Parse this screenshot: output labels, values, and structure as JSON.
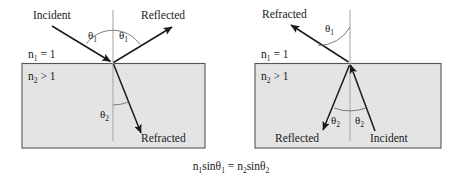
{
  "figure": {
    "equation": {
      "n1": "n",
      "n1_sub": "1",
      "sin1": "sinθ",
      "theta1_sub": "1",
      "equals": "=",
      "n2": "n",
      "n2_sub": "2",
      "sin2": "sinθ",
      "theta2_sub": "2"
    },
    "colors": {
      "medium_fill": "#e4e4e4",
      "medium_stroke": "#555555",
      "ray": "#1a1a1a",
      "normal": "#b0b0b0",
      "arc": "#6e6e6e",
      "background": "#ffffff"
    },
    "panels": [
      {
        "id": "left-panel",
        "name": "light-entering-denser-medium",
        "media": {
          "upper_label": "n",
          "upper_sub": "1",
          "upper_rel": " = 1",
          "lower_label": "n",
          "lower_sub": "2",
          "lower_rel": " > 1"
        },
        "rays": [
          {
            "name": "incident-ray",
            "label": "Incident",
            "direction": "down-right-to-interface"
          },
          {
            "name": "reflected-ray",
            "label": "Reflected",
            "direction": "up-right-from-interface"
          },
          {
            "name": "refracted-ray",
            "label": "Refracted",
            "direction": "down-right-into-medium"
          }
        ],
        "angles": [
          {
            "name": "theta1-incident",
            "symbol": "θ",
            "sub": "1",
            "side": "left-of-normal"
          },
          {
            "name": "theta1-reflected",
            "symbol": "θ",
            "sub": "1",
            "side": "right-of-normal"
          },
          {
            "name": "theta2-refracted",
            "symbol": "θ",
            "sub": "2",
            "side": "left-of-normal-below"
          }
        ]
      },
      {
        "id": "right-panel",
        "name": "light-exiting-denser-medium",
        "media": {
          "upper_label": "n",
          "upper_sub": "1",
          "upper_rel": " = 1",
          "lower_label": "n",
          "lower_sub": "2",
          "lower_rel": " > 1"
        },
        "rays": [
          {
            "name": "refracted-ray",
            "label": "Refracted",
            "direction": "up-left-from-interface"
          },
          {
            "name": "incident-ray",
            "label": "Incident",
            "direction": "up-left-to-interface"
          },
          {
            "name": "reflected-ray",
            "label": "Reflected",
            "direction": "down-left-from-interface"
          }
        ],
        "angles": [
          {
            "name": "theta1-refracted",
            "symbol": "θ",
            "sub": "1",
            "side": "left-of-normal-above"
          },
          {
            "name": "theta2-reflected",
            "symbol": "θ",
            "sub": "2",
            "side": "left-of-normal-below"
          },
          {
            "name": "theta2-incident",
            "symbol": "θ",
            "sub": "2",
            "side": "right-of-normal-below"
          }
        ]
      }
    ]
  }
}
